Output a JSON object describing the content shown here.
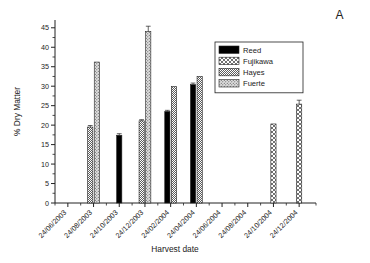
{
  "panel": {
    "letter": "A"
  },
  "chart_data": {
    "type": "bar",
    "title": "",
    "xlabel": "Harvest date",
    "ylabel": "% Dry Matter",
    "ylim": [
      0,
      47
    ],
    "yticks": [
      0,
      5,
      10,
      15,
      20,
      25,
      30,
      35,
      40,
      45
    ],
    "grid": false,
    "legend_position": "top-right",
    "categories": [
      "24/06/2003",
      "24/08/2003",
      "24/10/2003",
      "24/12/2003",
      "24/02/2004",
      "24/04/2004",
      "24/06/2004",
      "24/08/2004",
      "24/10/2004",
      "24/12/2004"
    ],
    "series": [
      {
        "name": "Reed",
        "pattern": "solid-black",
        "color": "#000000",
        "values": [
          null,
          null,
          17.4,
          null,
          23.5,
          30.4,
          null,
          null,
          null,
          null
        ],
        "errors": [
          null,
          null,
          0.4,
          null,
          0.3,
          0.4,
          null,
          null,
          null,
          null
        ]
      },
      {
        "name": "Fujikawa",
        "pattern": "cross-hatch",
        "color": "#ffffff",
        "values": [
          null,
          null,
          null,
          null,
          null,
          null,
          null,
          null,
          20.3,
          25.4
        ],
        "errors": [
          null,
          null,
          null,
          null,
          null,
          null,
          null,
          null,
          null,
          1.0
        ]
      },
      {
        "name": "Hayes",
        "pattern": "diagonal-stripes",
        "color": "#ffffff",
        "values": [
          null,
          19.5,
          null,
          21.1,
          29.9,
          32.5,
          null,
          null,
          null,
          null
        ],
        "errors": [
          null,
          0.4,
          null,
          0.3,
          null,
          null,
          null,
          null,
          null,
          null
        ]
      },
      {
        "name": "Fuerte",
        "pattern": "stipple",
        "color": "#c9c9c9",
        "values": [
          null,
          36.2,
          null,
          44.0,
          null,
          null,
          null,
          null,
          null,
          null
        ],
        "errors": [
          null,
          null,
          null,
          1.4,
          null,
          null,
          null,
          null,
          null,
          null
        ]
      }
    ]
  }
}
